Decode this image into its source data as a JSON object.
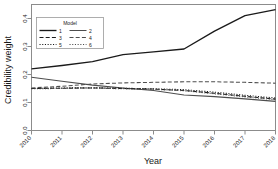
{
  "chart_data": {
    "type": "line",
    "title": "",
    "xlabel": "Year",
    "ylabel": "Credibility weight",
    "x": [
      2010,
      2011,
      2012,
      2013,
      2014,
      2015,
      2016,
      2017,
      2018
    ],
    "xticklabels": [
      "2010",
      "2011",
      "2012",
      "2013",
      "2014",
      "2015",
      "2016",
      "2017",
      "2018"
    ],
    "yticklabels": [
      "0.0",
      "0.1",
      "0.2",
      "0.3",
      "0.4"
    ],
    "yticks": [
      0.0,
      0.1,
      0.2,
      0.3,
      0.4
    ],
    "xlim": [
      2010,
      2018
    ],
    "ylim": [
      0.0,
      0.45
    ],
    "grid": false,
    "legend_position": "top-left",
    "legend_title": "Model",
    "series": [
      {
        "name": "1",
        "label": "1",
        "linestyle": "solid",
        "color": "#1a1a1a",
        "values": [
          0.22,
          0.232,
          0.246,
          0.271,
          0.281,
          0.291,
          0.355,
          0.41,
          0.432
        ]
      },
      {
        "name": "2",
        "label": "2",
        "linestyle": "solid",
        "color": "#4d4d4d",
        "values": [
          0.19,
          0.176,
          0.162,
          0.152,
          0.143,
          0.127,
          0.121,
          0.113,
          0.104
        ]
      },
      {
        "name": "3",
        "label": "3",
        "linestyle": "dashed",
        "color": "#1a1a1a",
        "values": [
          0.15,
          0.151,
          0.152,
          0.15,
          0.148,
          0.143,
          0.133,
          0.122,
          0.112
        ]
      },
      {
        "name": "4",
        "label": "4",
        "linestyle": "dashed",
        "color": "#4d4d4d",
        "values": [
          0.152,
          0.158,
          0.166,
          0.17,
          0.172,
          0.174,
          0.174,
          0.172,
          0.169
        ]
      },
      {
        "name": "5",
        "label": "5",
        "linestyle": "dotted",
        "color": "#1a1a1a",
        "values": [
          0.15,
          0.152,
          0.153,
          0.151,
          0.149,
          0.146,
          0.137,
          0.126,
          0.116
        ]
      },
      {
        "name": "6",
        "label": "6",
        "linestyle": "dotted",
        "color": "#4d4d4d",
        "values": [
          0.149,
          0.15,
          0.151,
          0.149,
          0.147,
          0.142,
          0.131,
          0.12,
          0.11
        ]
      }
    ]
  },
  "axes": {
    "x_title": "Year",
    "y_title": "Credibility weight"
  },
  "legend": {
    "title": "Model",
    "entries": [
      {
        "label": "1"
      },
      {
        "label": "2"
      },
      {
        "label": "3"
      },
      {
        "label": "4"
      },
      {
        "label": "5"
      },
      {
        "label": "6"
      }
    ]
  },
  "style": {
    "frame_color": "#808080",
    "text_color": "#1a1a1a",
    "background": "#ffffff"
  }
}
